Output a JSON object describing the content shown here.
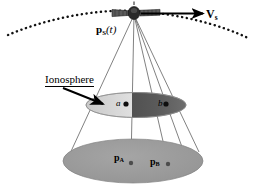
{
  "figure": {
    "domain": "diagram",
    "background_color": "#ffffff",
    "width": 258,
    "height": 186
  },
  "labels": {
    "satellite_position": {
      "symbol": "p",
      "subscript": "S",
      "argument": "(t)",
      "full_text": "pS(t)"
    },
    "velocity": {
      "symbol": "V",
      "subscript": "s",
      "full_text": "Vs"
    },
    "ionosphere": {
      "text": "Ionosphere",
      "underlined": true
    },
    "pierce_point_a": {
      "text": "a"
    },
    "pierce_point_b": {
      "text": "b"
    },
    "ground_point_a": {
      "symbol": "p",
      "subscript": "A",
      "full_text": "pA"
    },
    "ground_point_b": {
      "symbol": "p",
      "subscript": "B",
      "full_text": "pB"
    }
  },
  "elements": {
    "orbit_arc": {
      "name": "orbit-track",
      "style": "dotted",
      "color": "#111111"
    },
    "velocity_arrow": {
      "name": "velocity-arrow",
      "direction": "right",
      "color": "#000000"
    },
    "satellite": {
      "name": "satellite-icon",
      "body_color": "#3a3a3a",
      "panel_color": "#555555"
    },
    "ionosphere_disk": {
      "name": "ionosphere-layer",
      "left_half_color": "#d8d8d8",
      "right_half_color": "#4a4a4a",
      "outline_color": "#888888"
    },
    "ground_disk": {
      "name": "ground-plane",
      "fill_color": "#999999",
      "outline_color": "#7a7a7a"
    },
    "signal_rays": {
      "name": "signal-ray",
      "count": 5,
      "color": "#666666"
    },
    "pointer_arrow": {
      "name": "ionosphere-pointer-arrow",
      "color": "#000000"
    }
  },
  "colors": {
    "ink": "#000000",
    "ray": "#666666",
    "ground": "#999999",
    "iono_light": "#d8d8d8",
    "iono_dark": "#4a4a4a"
  }
}
